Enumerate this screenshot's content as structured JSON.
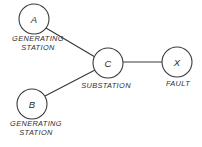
{
  "diagram": {
    "background_color": "#ffffff",
    "line_color": "#3a3a3a",
    "text_color": "#2e2e2e",
    "nodes": [
      {
        "id": "A",
        "letter": "A",
        "caption_line1": "GENERATING",
        "caption_line2": "STATION",
        "cx": 34,
        "cy": 19,
        "r": 15
      },
      {
        "id": "B",
        "letter": "B",
        "caption_line1": "GENERATING",
        "caption_line2": "STATION",
        "cx": 32,
        "cy": 104,
        "r": 15
      },
      {
        "id": "C",
        "letter": "C",
        "caption_line1": "SUBSTATION",
        "caption_line2": "",
        "cx": 108,
        "cy": 63,
        "r": 15
      },
      {
        "id": "X",
        "letter": "X",
        "caption_line1": "FAULT",
        "caption_line2": "",
        "cx": 177,
        "cy": 62,
        "r": 15
      }
    ],
    "edges": [
      {
        "id": "A-C",
        "from": "A",
        "to": "C",
        "x1": 46,
        "y1": 28,
        "x2": 95,
        "y2": 57
      },
      {
        "id": "B-C",
        "from": "B",
        "to": "C",
        "x1": 45,
        "y1": 96,
        "x2": 95,
        "y2": 70
      },
      {
        "id": "C-X",
        "from": "C",
        "to": "X",
        "x1": 123,
        "y1": 62,
        "x2": 162,
        "y2": 62
      }
    ],
    "captions": [
      {
        "id": "A-caption",
        "line1": "GENERATING",
        "line2": "STATION",
        "x": 38,
        "y": 41
      },
      {
        "id": "B-caption",
        "line1": "GENERATING",
        "line2": "STATION",
        "x": 36,
        "y": 126
      },
      {
        "id": "C-caption",
        "line1": "SUBSTATION",
        "line2": "",
        "x": 106,
        "y": 88
      },
      {
        "id": "X-caption",
        "line1": "FAULT",
        "line2": "",
        "x": 178,
        "y": 86
      }
    ]
  }
}
